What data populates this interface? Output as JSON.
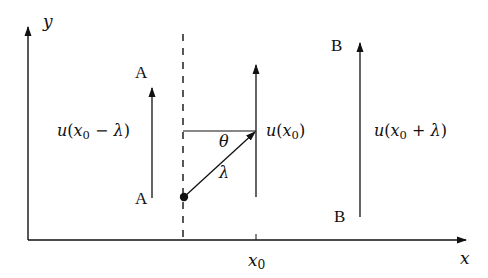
{
  "diagram": {
    "axes": {
      "x_label": "x",
      "y_label": "y"
    },
    "tick": {
      "label_var": "x",
      "label_sub": "0"
    },
    "points": {
      "A_top": "A",
      "A_bottom": "A",
      "B_top": "B",
      "B_bottom": "B"
    },
    "vectors": {
      "left": {
        "u": "u",
        "open": "(",
        "var": "x",
        "sub": "0",
        "op": " − ",
        "lam": "λ",
        "close": ")"
      },
      "center": {
        "u": "u",
        "open": "(",
        "var": "x",
        "sub": "0",
        "close": ")"
      },
      "right": {
        "u": "u",
        "open": "(",
        "var": "x",
        "sub": "0",
        "op": " + ",
        "lam": "λ",
        "close": ")"
      }
    },
    "angle_label": "θ",
    "segment_label": "λ",
    "colors": {
      "line": "#111111",
      "background": "#ffffff"
    }
  }
}
